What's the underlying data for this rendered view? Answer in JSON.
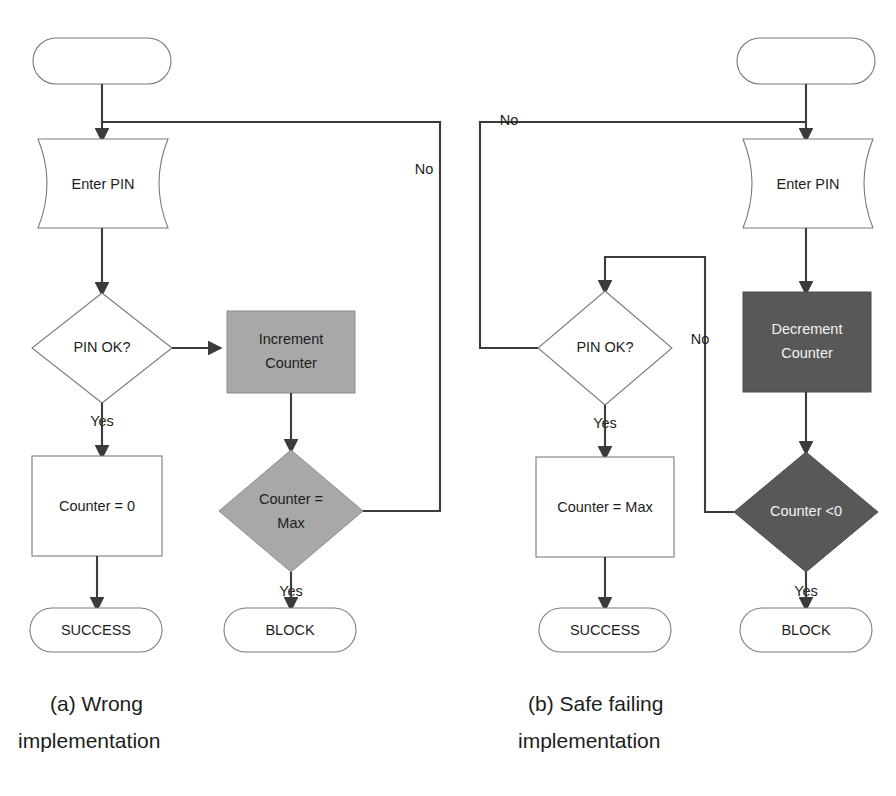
{
  "figure": {
    "background_color": "#ffffff"
  },
  "colors": {
    "outline_stroke": "#7b7b7b",
    "connector_stroke": "#3b3b3b",
    "fill_white": "#ffffff",
    "fill_gray_medium": "#a8a8a8",
    "fill_gray_dark": "#585858",
    "text_dark": "#1d1d1d",
    "text_light": "#f2f2f2"
  },
  "diagram_a": {
    "caption_line1": "(a) Wrong",
    "caption_line2": "implementation",
    "nodes": {
      "start": {
        "label": "",
        "shape": "terminator"
      },
      "enter_pin": {
        "label": "Enter PIN",
        "shape": "document"
      },
      "pin_ok": {
        "label": "PIN OK?",
        "shape": "decision"
      },
      "increment_counter": {
        "label_line1": "Increment",
        "label_line2": "Counter",
        "shape": "process",
        "fill": "#a8a8a8"
      },
      "counter_zero": {
        "label": "Counter = 0",
        "shape": "process",
        "fill": "#ffffff"
      },
      "counter_max": {
        "label_line1": "Counter =",
        "label_line2": "Max",
        "shape": "decision",
        "fill": "#a8a8a8"
      },
      "success": {
        "label": "SUCCESS",
        "shape": "terminator"
      },
      "block": {
        "label": "BLOCK",
        "shape": "terminator"
      }
    },
    "edge_labels": {
      "pin_ok_yes": "Yes",
      "counter_max_no": "No",
      "counter_max_yes": "Yes"
    }
  },
  "diagram_b": {
    "caption_line1": "(b) Safe failing",
    "caption_line2": "implementation",
    "nodes": {
      "start": {
        "label": "",
        "shape": "terminator"
      },
      "enter_pin": {
        "label": "Enter PIN",
        "shape": "document"
      },
      "pin_ok": {
        "label": "PIN OK?",
        "shape": "decision"
      },
      "decrement_counter": {
        "label_line1": "Decrement",
        "label_line2": "Counter",
        "shape": "process",
        "fill": "#585858"
      },
      "counter_max": {
        "label": "Counter = Max",
        "shape": "process",
        "fill": "#ffffff"
      },
      "counter_lt_zero": {
        "label": "Counter <0",
        "shape": "decision",
        "fill": "#585858"
      },
      "success": {
        "label": "SUCCESS",
        "shape": "terminator"
      },
      "block": {
        "label": "BLOCK",
        "shape": "terminator"
      }
    },
    "edge_labels": {
      "pin_ok_no": "No",
      "pin_ok_yes": "Yes",
      "counter_lt_zero_no": "No",
      "counter_lt_zero_yes": "Yes"
    }
  }
}
